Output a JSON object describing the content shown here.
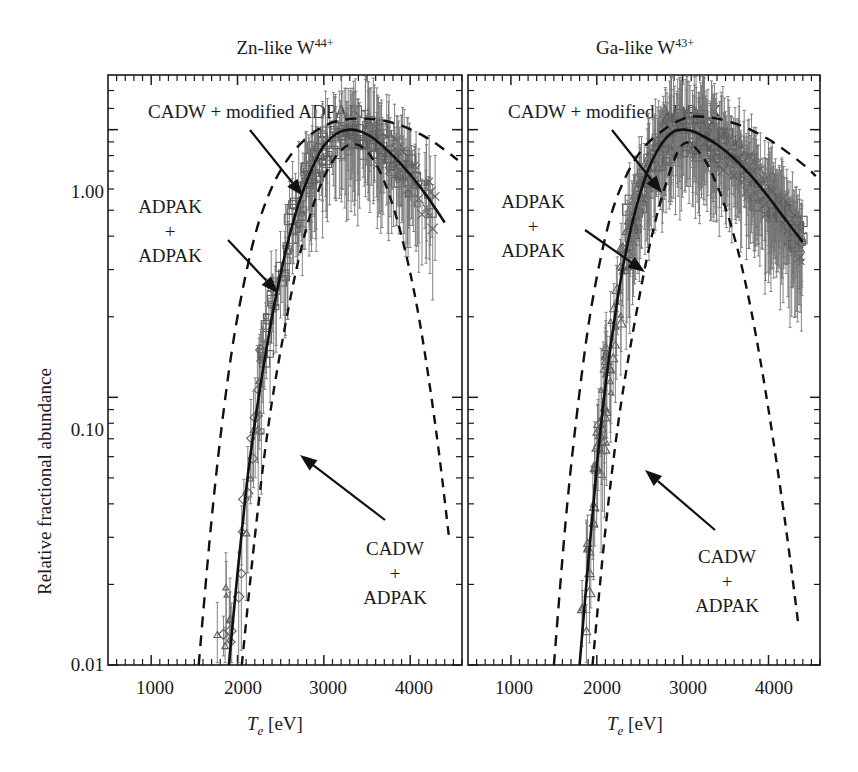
{
  "figure": {
    "ylabel": "Relative fractional abundance",
    "xlabel_main": "T",
    "xlabel_sub": "e",
    "xlabel_units": " [eV]",
    "ytick_labels": [
      "1.00",
      "0.10",
      "0.01"
    ],
    "ytick_values": [
      1.0,
      0.1,
      0.01
    ],
    "xtick_labels": [
      "1000",
      "2000",
      "3000",
      "4000"
    ],
    "xtick_values": [
      1000,
      2000,
      3000,
      4000
    ],
    "ink_color": "#1a1a1a",
    "marker_color": "#5e5e5e",
    "errorbar_color": "#777777"
  },
  "panels": [
    {
      "id": "left",
      "title_text": "Zn-like W",
      "title_sup": "44+",
      "annotations": [
        {
          "name": "cadw-modified-adpak",
          "text": "CADW + modified ADPAK"
        },
        {
          "name": "adpak-adpak",
          "lines": [
            "ADPAK",
            "+",
            "ADPAK"
          ]
        },
        {
          "name": "cadw-adpak",
          "lines": [
            "CADW",
            "+",
            "ADPAK"
          ]
        }
      ]
    },
    {
      "id": "right",
      "title_text": "Ga-like W",
      "title_sup": "43+",
      "annotations": [
        {
          "name": "cadw-modified-adpak",
          "text": "CADW + modified ADPAK"
        },
        {
          "name": "adpak-adpak",
          "lines": [
            "ADPAK",
            "+",
            "ADPAK"
          ]
        },
        {
          "name": "cadw-adpak",
          "lines": [
            "CADW",
            "+",
            "ADPAK"
          ]
        }
      ]
    }
  ],
  "chart_data": {
    "type": "line",
    "xlabel": "Te [eV]",
    "ylabel": "Relative fractional abundance",
    "xlim": [
      500,
      4600
    ],
    "ylim": [
      0.01,
      1.6
    ],
    "yscale": "log",
    "xscale": "linear",
    "grid": false,
    "legend": "none (inline text annotations with arrows)",
    "xticks": [
      1000,
      2000,
      3000,
      4000
    ],
    "yticks": [
      0.01,
      0.1,
      1.0
    ],
    "panels": [
      {
        "name": "Zn-like W44+",
        "series": [
          {
            "name": "CADW + modified ADPAK",
            "style": "solid",
            "peak_Te": 3300,
            "peak_value": 1.0,
            "x": [
              1900,
              2000,
              2100,
              2200,
              2300,
              2400,
              2500,
              2600,
              2700,
              2800,
              2900,
              3000,
              3100,
              3200,
              3300,
              3400,
              3500,
              3600,
              3800,
              4000,
              4200,
              4400
            ],
            "y": [
              0.01,
              0.022,
              0.045,
              0.08,
              0.13,
              0.2,
              0.29,
              0.4,
              0.52,
              0.64,
              0.76,
              0.87,
              0.94,
              0.985,
              1.0,
              0.99,
              0.96,
              0.915,
              0.8,
              0.68,
              0.56,
              0.45
            ]
          },
          {
            "name": "ADPAK + ADPAK",
            "style": "dashed",
            "peak_Te": 3450,
            "peak_value": 1.1,
            "x": [
              1550,
              1700,
              1850,
              2000,
              2200,
              2400,
              2600,
              2800,
              3000,
              3200,
              3450,
              3700,
              3950,
              4200,
              4400,
              4550
            ],
            "y": [
              0.01,
              0.035,
              0.095,
              0.2,
              0.4,
              0.61,
              0.79,
              0.93,
              1.03,
              1.085,
              1.1,
              1.08,
              1.02,
              0.93,
              0.84,
              0.77
            ]
          },
          {
            "name": "CADW + ADPAK",
            "style": "dashed",
            "peak_Te": 3300,
            "peak_value": 0.88,
            "x": [
              2050,
              2200,
              2350,
              2500,
              2700,
              2900,
              3100,
              3300,
              3500,
              3700,
              3900,
              4100,
              4300,
              4450
            ],
            "y": [
              0.01,
              0.03,
              0.075,
              0.15,
              0.32,
              0.55,
              0.76,
              0.88,
              0.83,
              0.64,
              0.4,
              0.2,
              0.075,
              0.03
            ]
          }
        ],
        "data_points": {
          "marker_shapes": [
            "square",
            "diamond",
            "triangle",
            "cross"
          ],
          "Te_range": [
            1700,
            4300
          ],
          "value_range": [
            0.025,
            1.25
          ],
          "description": "Experimental EBIT measurements with vertical error bars, clustered along the solid CADW + modified ADPAK curve"
        }
      },
      {
        "name": "Ga-like W43+",
        "series": [
          {
            "name": "CADW + modified ADPAK",
            "style": "solid",
            "peak_Te": 3000,
            "peak_value": 1.0,
            "x": [
              1800,
              1900,
              2000,
              2100,
              2200,
              2300,
              2400,
              2500,
              2600,
              2700,
              2800,
              2900,
              3000,
              3100,
              3200,
              3400,
              3600,
              3800,
              4000,
              4200,
              4400
            ],
            "y": [
              0.01,
              0.024,
              0.055,
              0.11,
              0.19,
              0.3,
              0.43,
              0.57,
              0.71,
              0.83,
              0.925,
              0.985,
              1.0,
              0.99,
              0.96,
              0.88,
              0.78,
              0.67,
              0.56,
              0.46,
              0.38
            ]
          },
          {
            "name": "ADPAK + ADPAK",
            "style": "dashed",
            "peak_Te": 3150,
            "peak_value": 1.12,
            "x": [
              1500,
              1650,
              1800,
              1950,
              2150,
              2350,
              2550,
              2800,
              3000,
              3150,
              3400,
              3700,
              4000,
              4250,
              4450,
              4550
            ],
            "y": [
              0.01,
              0.038,
              0.105,
              0.23,
              0.46,
              0.68,
              0.86,
              1.01,
              1.095,
              1.12,
              1.1,
              1.03,
              0.92,
              0.81,
              0.72,
              0.67
            ]
          },
          {
            "name": "CADW + ADPAK",
            "style": "dashed",
            "peak_Te": 3000,
            "peak_value": 0.88,
            "x": [
              1950,
              2100,
              2250,
              2400,
              2600,
              2800,
              3000,
              3200,
              3400,
              3600,
              3800,
              4000,
              4200,
              4350
            ],
            "y": [
              0.01,
              0.032,
              0.08,
              0.16,
              0.35,
              0.62,
              0.88,
              0.82,
              0.62,
              0.4,
              0.21,
              0.09,
              0.033,
              0.014
            ]
          }
        ],
        "data_points": {
          "marker_shapes": [
            "square",
            "triangle",
            "cross",
            "diamond"
          ],
          "Te_range": [
            1750,
            4400
          ],
          "value_range": [
            0.02,
            1.25
          ],
          "description": "Dense experimental EBIT measurements with vertical error bars following the solid CADW + modified ADPAK curve"
        }
      }
    ]
  }
}
